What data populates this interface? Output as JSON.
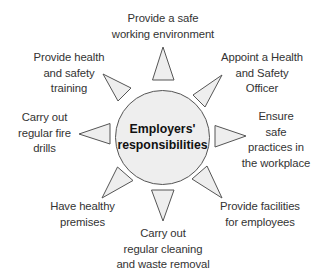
{
  "diagram": {
    "title": [
      "Employers'",
      "responsibilities"
    ],
    "colors": {
      "fill": "#eeeeee",
      "stroke": "#555555",
      "text": "#333333",
      "center_text": "#111111"
    },
    "items": [
      {
        "id": "safe-working-environment",
        "direction": "top",
        "lines": [
          "Provide a safe",
          "working environment"
        ]
      },
      {
        "id": "appoint-officer",
        "direction": "top-right",
        "lines": [
          "Appoint a Health",
          "and Safety",
          "Officer"
        ]
      },
      {
        "id": "safe-practices",
        "direction": "right",
        "lines": [
          "Ensure",
          "safe",
          "practices in",
          "the workplace"
        ]
      },
      {
        "id": "facilities",
        "direction": "bottom-right",
        "lines": [
          "Provide facilities",
          "for employees"
        ]
      },
      {
        "id": "cleaning",
        "direction": "bottom",
        "lines": [
          "Carry out",
          "regular cleaning",
          "and waste removal"
        ]
      },
      {
        "id": "healthy-premises",
        "direction": "bottom-left",
        "lines": [
          "Have healthy",
          "premises"
        ]
      },
      {
        "id": "fire-drills",
        "direction": "left",
        "lines": [
          "Carry out",
          "regular fire",
          "drills"
        ]
      },
      {
        "id": "training",
        "direction": "top-left",
        "lines": [
          "Provide health",
          "and safety",
          "training"
        ]
      }
    ]
  }
}
